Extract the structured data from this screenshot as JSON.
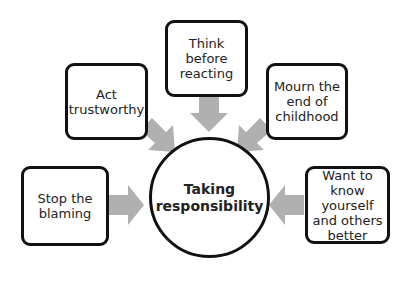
{
  "diagram": {
    "type": "hub-and-spoke",
    "center": {
      "label": "Taking responsibility"
    },
    "nodes": [
      {
        "id": "act",
        "label": "Act trustworthy"
      },
      {
        "id": "think",
        "label": "Think before reacting"
      },
      {
        "id": "mourn",
        "label": "Mourn the end of childhood"
      },
      {
        "id": "stop",
        "label": "Stop the blaming"
      },
      {
        "id": "want",
        "label": "Want to know yourself and others better"
      }
    ],
    "colors": {
      "arrow": "#b0b0b0",
      "border": "#111111",
      "background": "#ffffff"
    }
  }
}
